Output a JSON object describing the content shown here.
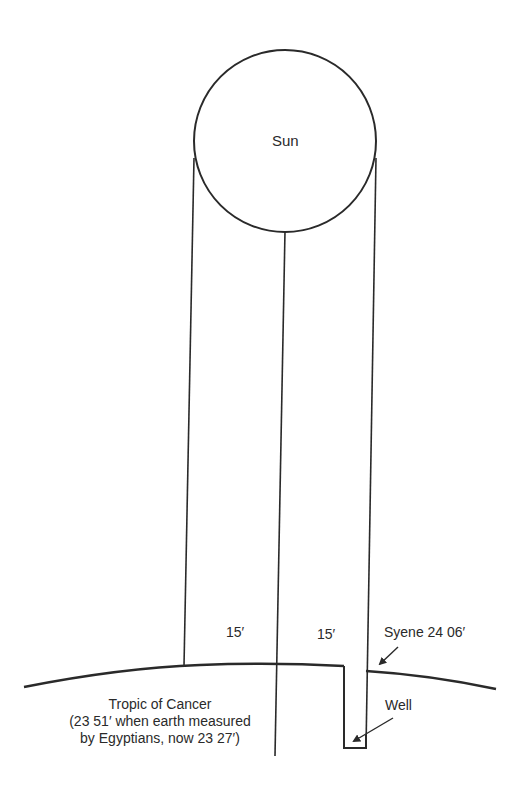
{
  "diagram": {
    "stroke_color": "#2a2a2a",
    "background": "#ffffff",
    "labels": {
      "sun": "Sun",
      "angle_left": "15′",
      "angle_right": "15′",
      "syene": "Syene  24  06′",
      "well": "Well",
      "tropic_line1": "Tropic of Cancer",
      "tropic_line2": "(23  51′ when earth measured",
      "tropic_line3": "by Egyptians, now 23  27′)"
    },
    "elements": [
      {
        "name": "sun-circle",
        "type": "circle",
        "cx": 285,
        "cy": 141,
        "r": 91
      },
      {
        "name": "ray-left",
        "type": "line",
        "from": [
          194,
          158
        ],
        "to": [
          184,
          666
        ]
      },
      {
        "name": "ray-center",
        "type": "line",
        "from": [
          285,
          230
        ],
        "to": [
          275,
          756
        ]
      },
      {
        "name": "ray-right",
        "type": "line",
        "from": [
          376,
          158
        ],
        "to": [
          366,
          748
        ]
      },
      {
        "name": "earth-surface-arc",
        "type": "curve"
      },
      {
        "name": "well-shaft",
        "type": "polyline"
      },
      {
        "name": "syene-arrow",
        "type": "arrow",
        "from": [
          398,
          647
        ],
        "to": [
          378,
          666
        ]
      },
      {
        "name": "well-arrow",
        "type": "arrow",
        "from": [
          393,
          718
        ],
        "to": [
          352,
          742
        ]
      }
    ]
  }
}
